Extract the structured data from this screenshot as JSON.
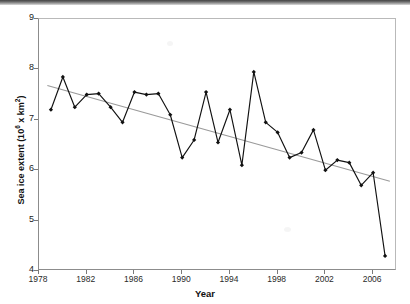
{
  "chart_data": {
    "type": "line",
    "title": "",
    "xlabel": "Year",
    "ylabel": "Sea ice extent (10⁶ x km²)",
    "ylabel_base": "Sea ice extent (10",
    "ylabel_sup": "6",
    "ylabel_tail": " x km",
    "ylabel_sup2": "2",
    "ylabel_close": ")",
    "xlim": [
      1978,
      2008
    ],
    "ylim": [
      4,
      9
    ],
    "grid": false,
    "legend": null,
    "x_ticks": [
      1978,
      1982,
      1986,
      1990,
      1994,
      1998,
      2002,
      2006
    ],
    "y_ticks": [
      4,
      5,
      6,
      7,
      8,
      9
    ],
    "x_tick_labels": [
      "1978",
      "1982",
      "1986",
      "1990",
      "1994",
      "1998",
      "2002",
      "2006"
    ],
    "y_tick_labels": [
      "4",
      "5",
      "6",
      "7",
      "8",
      "9"
    ],
    "series": [
      {
        "name": "Sea ice extent",
        "style": "line-with-markers",
        "color": "#111111",
        "marker": "diamond",
        "x": [
          1979,
          1980,
          1981,
          1982,
          1983,
          1984,
          1985,
          1986,
          1987,
          1988,
          1989,
          1990,
          1991,
          1992,
          1993,
          1994,
          1995,
          1996,
          1997,
          1998,
          1999,
          2000,
          2001,
          2002,
          2003,
          2004,
          2005,
          2006,
          2007
        ],
        "values": [
          7.2,
          7.85,
          7.25,
          7.5,
          7.52,
          7.25,
          6.95,
          7.55,
          7.5,
          7.52,
          7.1,
          6.25,
          6.6,
          7.55,
          6.55,
          7.2,
          6.1,
          7.95,
          6.95,
          6.75,
          6.25,
          6.35,
          6.8,
          6.0,
          6.2,
          6.15,
          5.7,
          5.95,
          4.3
        ]
      },
      {
        "name": "Linear trend",
        "style": "trend-line",
        "color": "#9a9a9a",
        "marker": "none",
        "x": [
          1978.7,
          2007.4
        ],
        "values": [
          7.68,
          5.78
        ]
      }
    ]
  },
  "axes": {
    "y_title": "Sea ice extent (10⁶ x km²)",
    "x_title": "Year"
  }
}
